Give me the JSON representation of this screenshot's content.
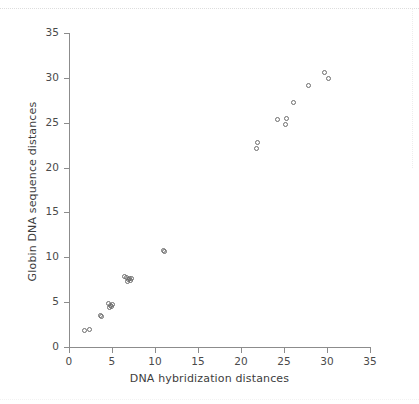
{
  "figure": {
    "background_color": "#ffffff",
    "marker_color": "#6d6d6d",
    "axis_color": "#8c8c8c",
    "text_color": "#3d3d3d"
  },
  "chart_data": {
    "type": "scatter",
    "title": "",
    "xlabel": "DNA hybridization distances",
    "ylabel": "Globin DNA sequence distances",
    "xlim": [
      0,
      35
    ],
    "ylim": [
      0,
      35
    ],
    "xticks": [
      0,
      5,
      10,
      15,
      20,
      25,
      30,
      35
    ],
    "yticks": [
      0,
      5,
      10,
      15,
      20,
      25,
      30,
      35
    ],
    "xticklabels": [
      "0",
      "5",
      "10",
      "15",
      "20",
      "25",
      "30",
      "35"
    ],
    "yticklabels": [
      "0",
      "5",
      "10",
      "15",
      "20",
      "25",
      "30",
      "35"
    ],
    "grid": false,
    "legend": null,
    "marker": "open-circle",
    "points": [
      [
        1.8,
        1.85
      ],
      [
        2.35,
        1.9
      ],
      [
        3.7,
        3.5
      ],
      [
        3.75,
        3.35
      ],
      [
        4.6,
        4.8
      ],
      [
        4.8,
        4.65
      ],
      [
        4.95,
        4.55
      ],
      [
        4.7,
        4.45
      ],
      [
        5.0,
        4.75
      ],
      [
        6.5,
        7.9
      ],
      [
        6.7,
        7.7
      ],
      [
        6.9,
        7.5
      ],
      [
        7.05,
        7.65
      ],
      [
        7.15,
        7.45
      ],
      [
        6.8,
        7.25
      ],
      [
        7.25,
        7.6
      ],
      [
        11.0,
        10.75
      ],
      [
        11.05,
        10.6
      ],
      [
        21.9,
        22.8
      ],
      [
        21.85,
        22.1
      ],
      [
        24.2,
        25.4
      ],
      [
        25.3,
        25.5
      ],
      [
        25.2,
        24.8
      ],
      [
        26.1,
        27.3
      ],
      [
        27.9,
        29.2
      ],
      [
        29.7,
        30.6
      ],
      [
        30.2,
        29.9
      ]
    ]
  }
}
